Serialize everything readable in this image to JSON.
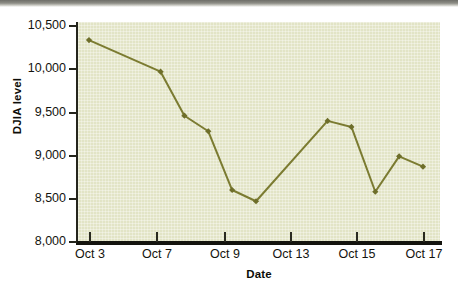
{
  "chart_data": {
    "type": "line",
    "title": "",
    "xlabel": "Date",
    "ylabel": "DJIA level",
    "categories": [
      "Oct 3",
      "Oct 6",
      "Oct 7",
      "Oct 8",
      "Oct 9",
      "Oct 10",
      "Oct 13",
      "Oct 14",
      "Oct 15",
      "Oct 16",
      "Oct 17"
    ],
    "x": [
      3,
      6,
      7,
      8,
      9,
      10,
      13,
      14,
      15,
      16,
      17
    ],
    "values": [
      10325,
      9960,
      9450,
      9270,
      8590,
      8460,
      9390,
      9320,
      8570,
      8980,
      8860
    ],
    "xtick_labels": [
      "Oct 3",
      "Oct 7",
      "Oct 9",
      "Oct 13",
      "Oct 15",
      "Oct 17"
    ],
    "xtick_values": [
      3,
      7,
      9,
      13,
      15,
      17
    ],
    "ytick_labels": [
      "10,500",
      "10,000",
      "9,500",
      "9,000",
      "8,500",
      "8,000"
    ],
    "ytick_values": [
      10500,
      10000,
      9500,
      9000,
      8500,
      8000
    ],
    "ylim": [
      8000,
      10500
    ],
    "xlim": [
      2,
      18
    ],
    "grid": false,
    "legend": false,
    "series": [
      {
        "name": "DJIA level",
        "values": [
          10325,
          9960,
          9450,
          9270,
          8590,
          8460,
          9390,
          9320,
          8570,
          8980,
          8860
        ]
      }
    ],
    "colors": {
      "line": "#7b7b31",
      "marker": "#6e6e2a",
      "plot_background": "#e2e4c6",
      "axis": "#14140e",
      "text": "#14140e"
    },
    "marker_style": "diamond"
  }
}
